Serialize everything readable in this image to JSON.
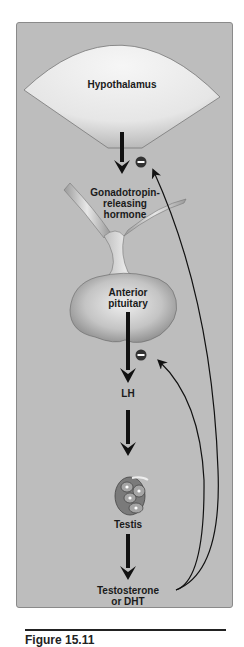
{
  "diagram": {
    "nodes": [
      {
        "id": "hypothalamus",
        "label": "Hypothalamus"
      },
      {
        "id": "gnrh",
        "label": "Gonadotropin-\nreleasing\nhormone"
      },
      {
        "id": "anterior_pituitary",
        "label": "Anterior\npituitary"
      },
      {
        "id": "lh",
        "label": "LH"
      },
      {
        "id": "testis",
        "label": "Testis"
      },
      {
        "id": "testosterone",
        "label": "Testosterone\nor DHT"
      }
    ],
    "edges": [
      {
        "from": "hypothalamus",
        "to": "gnrh",
        "type": "stimulates"
      },
      {
        "from": "anterior_pituitary",
        "to": "lh",
        "type": "stimulates"
      },
      {
        "from": "lh",
        "to": "testis",
        "type": "stimulates"
      },
      {
        "from": "testis",
        "to": "testosterone",
        "type": "stimulates"
      },
      {
        "from": "testosterone",
        "to": "hypothalamus",
        "type": "inhibits",
        "symbol": "−"
      },
      {
        "from": "testosterone",
        "to": "anterior_pituitary",
        "type": "inhibits",
        "symbol": "−"
      }
    ],
    "inhibit_symbol": "−",
    "colors": {
      "panel": "#bdbdbd",
      "organ_light": "#f2f2f2",
      "organ_dark": "#8f8f8f",
      "arrow": "#111111",
      "inhibit_badge": "#333333"
    }
  },
  "caption": {
    "text": "Figure 15.11"
  }
}
